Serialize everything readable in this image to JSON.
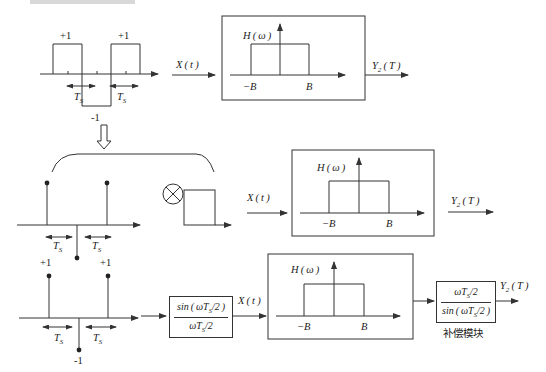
{
  "diagram": {
    "type": "block-diagram",
    "colors": {
      "stroke": "#333333",
      "text": "#222222",
      "background": "#ffffff"
    },
    "row1": {
      "waveform": {
        "plus_left": "+1",
        "plus_right": "+1",
        "minus": "-1",
        "ts_left": "T",
        "ts_right": "T",
        "ts_sub": "S"
      },
      "input_label": "X ( t )",
      "filter": {
        "title": "H ( ω )",
        "neg_b": "−B",
        "pos_b": "B"
      },
      "output_label": "Y",
      "output_sub": "2",
      "output_arg": " ( T )"
    },
    "row2": {
      "impulses": {
        "ts_left": "T",
        "ts_right": "T",
        "ts_sub": "S",
        "plus_left": "+1",
        "plus_right": "+1"
      },
      "operator": "convolution-otimes",
      "input_label": "X ( t )",
      "filter": {
        "title": "H ( ω )",
        "neg_b": "−B",
        "pos_b": "B"
      },
      "output_label": "Y",
      "output_sub": "2",
      "output_arg": " ( T )"
    },
    "row3": {
      "impulses": {
        "ts_left": "T",
        "ts_right": "T",
        "ts_sub": "S",
        "minus": "-1"
      },
      "sinc_block": {
        "numerator": "sin ( ωT",
        "numerator_sub": "S",
        "numerator_tail": "/2 )",
        "denominator": "ωT",
        "denominator_sub": "S",
        "denominator_tail": "/2"
      },
      "input_label": "X ( t )",
      "filter": {
        "title": "H ( ω )",
        "neg_b": "−B",
        "pos_b": "B"
      },
      "compensation_block": {
        "numerator": "ωT",
        "numerator_sub": "S",
        "numerator_tail": "/2",
        "denominator": "sin ( ωT",
        "denominator_sub": "S",
        "denominator_tail": "/2 )",
        "caption": "补偿模块"
      },
      "output_label": "Y",
      "output_sub": "2",
      "output_arg": " ( T )"
    }
  }
}
